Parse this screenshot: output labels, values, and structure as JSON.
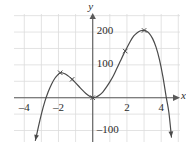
{
  "chart_data": {
    "type": "line",
    "title": "",
    "subtitle": "",
    "xlabel": "x",
    "ylabel": "y",
    "xlim": [
      -4.6,
      5.1
    ],
    "ylim": [
      -135,
      255
    ],
    "grid": true,
    "grid_spacing_x": 1,
    "grid_spacing_y": 50,
    "legend": "none",
    "x_ticks": [
      -4,
      -2,
      2,
      4
    ],
    "x_tick_labels": [
      "–4",
      "–2",
      "2",
      "4"
    ],
    "y_ticks": [
      -100,
      100,
      200
    ],
    "y_tick_labels": [
      "–100",
      "100",
      "200"
    ],
    "axis_arrow_x": "right",
    "axis_arrow_y": "up",
    "curve_arrow_start": "down-left",
    "curve_arrow_end": "down-right",
    "series": [
      {
        "name": "polynomial",
        "x": [
          -3.35,
          -3.2,
          -3.0,
          -2.8,
          -2.6,
          -2.4,
          -2.2,
          -2.0,
          -1.9,
          -1.8,
          -1.6,
          -1.4,
          -1.2,
          -1.0,
          -0.8,
          -0.6,
          -0.4,
          -0.2,
          0.0,
          0.2,
          0.4,
          0.6,
          0.8,
          1.0,
          1.2,
          1.4,
          1.6,
          1.8,
          2.0,
          2.2,
          2.4,
          2.6,
          2.8,
          3.0,
          3.1,
          3.3,
          3.5,
          3.7,
          3.9,
          4.1,
          4.3,
          4.45,
          4.6
        ],
        "y": [
          -130,
          -95,
          -50,
          -12,
          18,
          42,
          60,
          72,
          75,
          76,
          72,
          65,
          56,
          45,
          34,
          23,
          13,
          5,
          0,
          2,
          8,
          18,
          32,
          48,
          66,
          88,
          110,
          132,
          152,
          172,
          188,
          198,
          204,
          205,
          204,
          196,
          180,
          154,
          116,
          64,
          0,
          -45,
          -120
        ]
      }
    ],
    "markers": [
      {
        "name": "local-max-left",
        "x": -1.9,
        "y": 76
      },
      {
        "name": "point-descending-left",
        "x": -1.2,
        "y": 56
      },
      {
        "name": "local-min-origin",
        "x": 0,
        "y": 0
      },
      {
        "name": "point-ascending-right",
        "x": 1.9,
        "y": 142
      },
      {
        "name": "local-max-right",
        "x": 3.0,
        "y": 205
      }
    ],
    "colors": {
      "curve": "#4a4a4a",
      "axis": "#5a5a5a",
      "grid": "#dcdcdc",
      "text": "#2b2b2b",
      "background": "#ffffff"
    }
  }
}
